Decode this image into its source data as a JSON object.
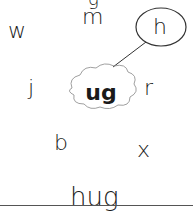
{
  "worksheet": {
    "top_cut_glyph": "g",
    "center_chunk": "ug",
    "letters": [
      {
        "char": "w",
        "circled": false
      },
      {
        "char": "m",
        "circled": false
      },
      {
        "char": "h",
        "circled": true
      },
      {
        "char": "j",
        "circled": false
      },
      {
        "char": "r",
        "circled": false
      },
      {
        "char": "b",
        "circled": false
      },
      {
        "char": "x",
        "circled": false
      }
    ],
    "answer": "hug"
  }
}
